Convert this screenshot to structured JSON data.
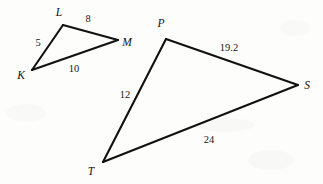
{
  "figure": {
    "background_color": "#fdfdfc",
    "stroke_color": "#111111",
    "label_color": "#121212",
    "triangles": [
      {
        "name": "triangle-klm",
        "vertices": [
          {
            "label": "K",
            "x": 32,
            "y": 70,
            "label_x": 21,
            "label_y": 76
          },
          {
            "label": "L",
            "x": 63,
            "y": 25,
            "label_x": 59,
            "label_y": 13
          },
          {
            "label": "M",
            "x": 118,
            "y": 40,
            "label_x": 127,
            "label_y": 43
          }
        ],
        "edges": [
          {
            "from": "K",
            "to": "L",
            "length": "5",
            "label_x": 38,
            "label_y": 44
          },
          {
            "from": "L",
            "to": "M",
            "length": "8",
            "label_x": 88,
            "label_y": 20
          },
          {
            "from": "K",
            "to": "M",
            "length": "10",
            "label_x": 74,
            "label_y": 70
          }
        ]
      },
      {
        "name": "triangle-pst",
        "vertices": [
          {
            "label": "P",
            "x": 166,
            "y": 39,
            "label_x": 161,
            "label_y": 24
          },
          {
            "label": "S",
            "x": 298,
            "y": 85,
            "label_x": 307,
            "label_y": 86
          },
          {
            "label": "T",
            "x": 103,
            "y": 162,
            "label_x": 91,
            "label_y": 172
          }
        ],
        "edges": [
          {
            "from": "P",
            "to": "S",
            "length": "19.2",
            "label_x": 229,
            "label_y": 49
          },
          {
            "from": "T",
            "to": "S",
            "length": "24",
            "label_x": 209,
            "label_y": 141
          },
          {
            "from": "P",
            "to": "T",
            "length": "12",
            "label_x": 125,
            "label_y": 96
          }
        ]
      }
    ]
  }
}
